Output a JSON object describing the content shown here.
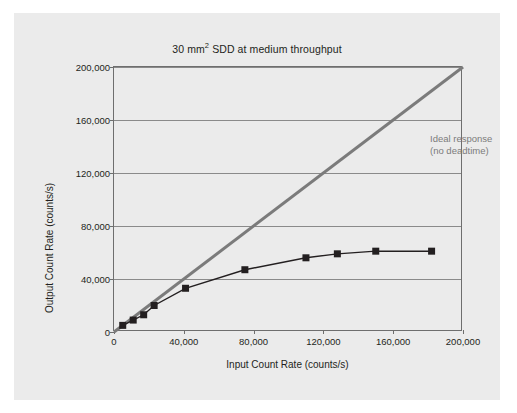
{
  "figure": {
    "title_main": "30 mm",
    "title_sup": "2",
    "title_rest": " SDD at medium throughput",
    "background_color": "#ebebeb",
    "page_background": "#ffffff"
  },
  "annotation": {
    "line1": "Ideal response",
    "line2": "(no deadtime)",
    "color": "#7b7b7b"
  },
  "chart_data": {
    "type": "line",
    "title": "30 mm2 SDD at medium throughput",
    "xlabel": "Input Count Rate (counts/s)",
    "ylabel": "Output Count Rate (counts/s)",
    "xlim": [
      0,
      200000
    ],
    "ylim": [
      0,
      200000
    ],
    "xticks": [
      0,
      40000,
      80000,
      120000,
      160000,
      200000
    ],
    "yticks": [
      0,
      40000,
      80000,
      120000,
      160000,
      200000
    ],
    "xtick_labels": [
      "0",
      "40,000",
      "80,000",
      "120,000",
      "160,000",
      "200,000"
    ],
    "ytick_labels": [
      "0",
      "40,000",
      "80,000",
      "120,000",
      "160,000",
      "200,000"
    ],
    "grid": "horizontal",
    "legend": "none",
    "series": [
      {
        "name": "Ideal response (no deadtime)",
        "type": "line",
        "color": "#7b7b7b",
        "width": 3,
        "marker": "none",
        "x": [
          0,
          200000
        ],
        "values": [
          0,
          200000
        ]
      },
      {
        "name": "Measured output count rate",
        "type": "line",
        "color": "#231f20",
        "width": 1.4,
        "marker": "square",
        "marker_size": 7,
        "x": [
          5000,
          11000,
          17000,
          23000,
          41000,
          75000,
          110000,
          128000,
          150000,
          182000
        ],
        "values": [
          5000,
          9000,
          13000,
          20000,
          33000,
          47000,
          56000,
          59000,
          61000,
          61000
        ]
      }
    ],
    "annotations": [
      {
        "text": "Ideal response (no deadtime)",
        "x": 118000,
        "y": 182000,
        "color": "#7b7b7b"
      }
    ]
  }
}
